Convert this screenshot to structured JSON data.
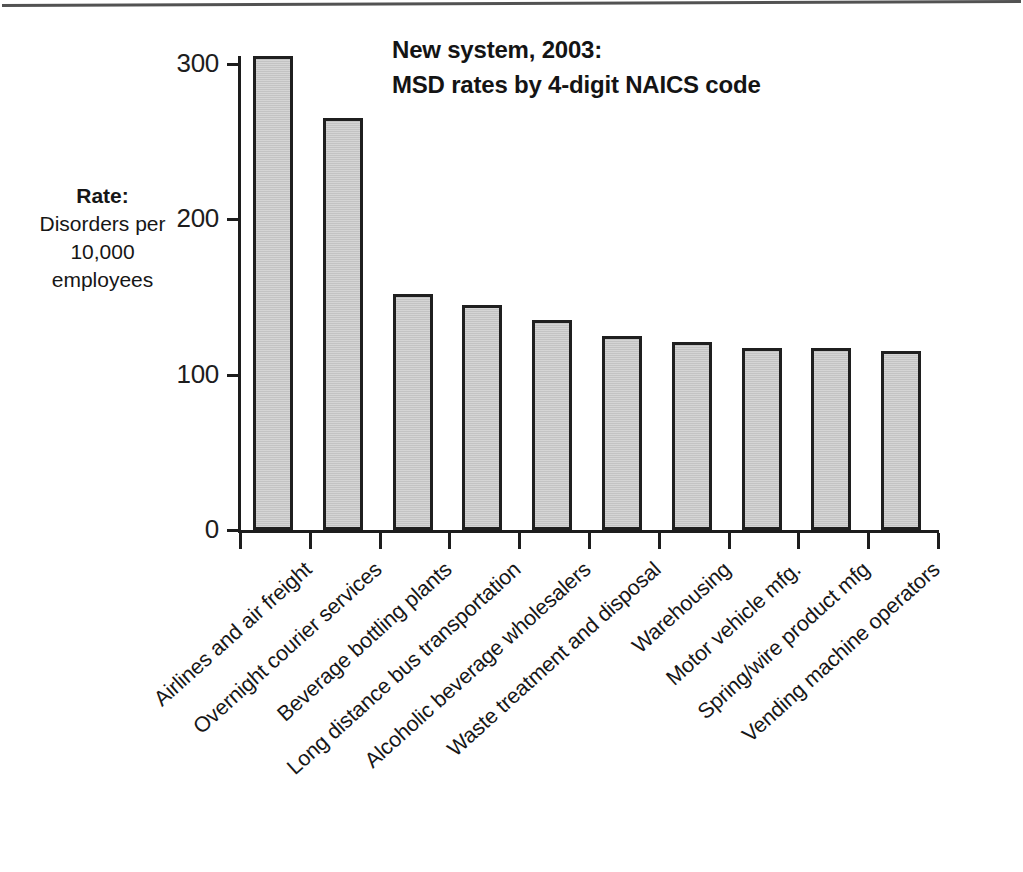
{
  "chart_data": {
    "type": "bar",
    "title": "New system, 2003: MSD rates by 4-digit NAICS code",
    "title_lines": [
      "New system, 2003:",
      "MSD rates by 4-digit NAICS code"
    ],
    "ylabel_lines": [
      "Rate:",
      "Disorders per",
      "10,000",
      "employees"
    ],
    "ylabel": "Rate: Disorders per 10,000 employees",
    "xlabel": "",
    "ylim": [
      0,
      320
    ],
    "yticks": [
      0,
      100,
      200,
      300
    ],
    "ytick_labels": [
      "0",
      "100",
      "200",
      "300"
    ],
    "grid": false,
    "legend": null,
    "bar_color": "#c9c9c9",
    "bar_border_color": "#1f1f1f",
    "axis_color": "#1d1d1d",
    "categories": [
      "Airlines and air freight",
      "Overnight courier services",
      "Beverage bottling plants",
      "Long distance bus transportation",
      "Alcoholic beverage wholesalers",
      "Waste treatment and disposal",
      "Warehousing",
      "Motor vehicle mfg.",
      "Spring/wire product mfg",
      "Vending machine operators"
    ],
    "values": [
      305,
      265,
      152,
      145,
      135,
      125,
      121,
      117,
      117,
      115
    ]
  }
}
